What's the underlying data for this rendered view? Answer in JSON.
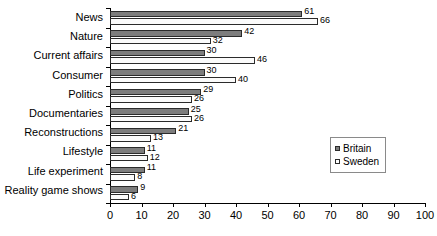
{
  "chart_data": {
    "type": "bar",
    "orientation": "horizontal",
    "title": "",
    "xlabel": "",
    "ylabel": "",
    "xlim": [
      0,
      100
    ],
    "xticks": [
      0,
      10,
      20,
      30,
      40,
      50,
      60,
      70,
      80,
      90,
      100
    ],
    "grid": false,
    "legend_position": "center-right",
    "categories": [
      "News",
      "Nature",
      "Current affairs",
      "Consumer",
      "Politics",
      "Documentaries",
      "Reconstructions",
      "Lifestyle",
      "Life experiment",
      "Reality game shows"
    ],
    "series": [
      {
        "name": "Britain",
        "color": "#7d7d7d",
        "values": [
          61,
          42,
          30,
          30,
          29,
          25,
          21,
          11,
          11,
          9
        ]
      },
      {
        "name": "Sweden",
        "color": "#ffffff",
        "values": [
          66,
          32,
          46,
          40,
          26,
          26,
          13,
          12,
          8,
          6
        ]
      }
    ]
  },
  "legend": {
    "items": [
      {
        "label": "Britain",
        "swatch": "britain"
      },
      {
        "label": "Sweden",
        "swatch": "sweden"
      }
    ]
  }
}
